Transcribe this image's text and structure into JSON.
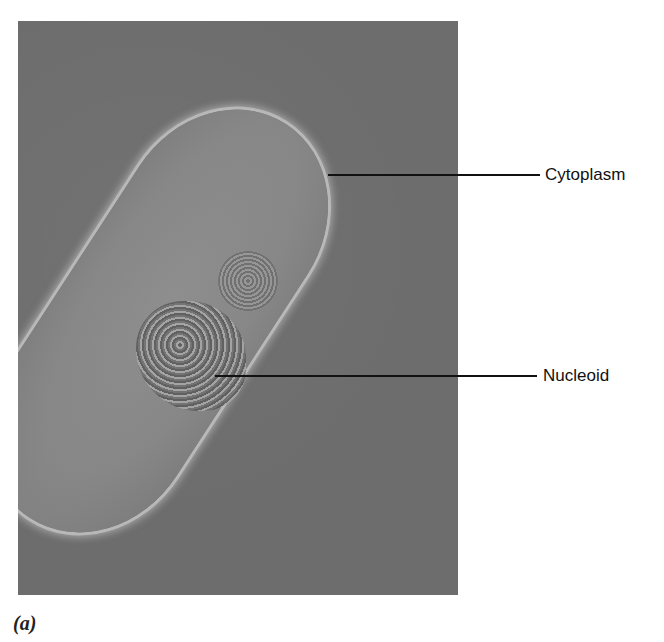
{
  "figure": {
    "panel_label": "(a)",
    "image_description": "Electron micrograph of a rod-shaped bacterial cell, freeze-fracture view",
    "labels": [
      {
        "text": "Cytoplasm"
      },
      {
        "text": "Nucleoid"
      }
    ],
    "colors": {
      "background": "#ffffff",
      "micrograph_field": "#6d6d6d",
      "cell_body": "#888888",
      "leader_line": "#111111"
    }
  }
}
